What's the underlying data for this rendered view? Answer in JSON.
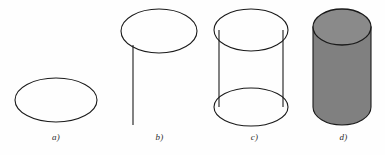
{
  "figure": {
    "background_color": "#fefefe",
    "width": 385,
    "height": 155
  },
  "style": {
    "stroke_color": "#1a1a1a",
    "stroke_width": 1.1,
    "fill_gray": "#808080",
    "fill_gray_top": "#8a8a8a",
    "label_color": "#2b2b2b"
  },
  "panels": [
    {
      "id": "a",
      "label": "a)",
      "name": "ellipse-only",
      "description": "A single empty ellipse outline",
      "shapes": {
        "ellipse_top": {
          "cx": 56,
          "cy": 100,
          "rx": 41,
          "ry": 22
        }
      }
    },
    {
      "id": "b",
      "label": "b)",
      "name": "ellipse-with-vertical-line",
      "description": "An ellipse at the top with a single vertical line descending from its left edge",
      "shapes": {
        "ellipse_top": {
          "cx": 47,
          "cy": 31,
          "rx": 38,
          "ry": 22
        },
        "vertical_line": {
          "x": 21,
          "y1": 45,
          "y2": 125
        }
      }
    },
    {
      "id": "c",
      "label": "c)",
      "name": "wireframe-cylinder",
      "description": "Two ellipses joined by two vertical side lines forming a transparent wireframe cylinder",
      "shapes": {
        "ellipse_top": {
          "cx": 44,
          "cy": 30,
          "rx": 37,
          "ry": 21
        },
        "ellipse_bottom": {
          "cx": 44,
          "cy": 107,
          "rx": 37,
          "ry": 19
        },
        "vertical_line_left": {
          "x": 12,
          "y1": 30,
          "y2": 107
        },
        "vertical_line_right": {
          "x": 76,
          "y1": 30,
          "y2": 107
        }
      }
    },
    {
      "id": "d",
      "label": "d)",
      "name": "shaded-solid-cylinder",
      "description": "A solid gray-filled cylinder with visible top ellipse and hidden bottom edge",
      "shapes": {
        "ellipse_top": {
          "cx": 40,
          "cy": 27,
          "rx": 29,
          "ry": 18
        },
        "body": {
          "x_left": 11,
          "x_right": 69,
          "y_top": 27,
          "y_bottom": 107
        },
        "ellipse_bottom": {
          "cx": 40,
          "cy": 107,
          "rx": 29,
          "ry": 18
        }
      }
    }
  ]
}
